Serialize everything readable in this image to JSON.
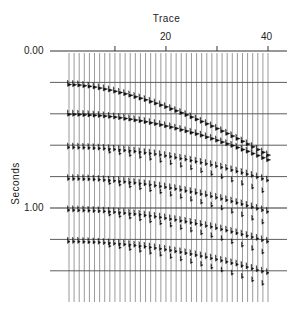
{
  "chart_data": {
    "type": "line",
    "title": "Trace",
    "xlabel": "Trace",
    "ylabel": "Seconds",
    "x_ticks": [
      10,
      20,
      30,
      40
    ],
    "x_tick_labels": [
      "",
      "20",
      "",
      "40"
    ],
    "y_tick_labels": [
      "0.00",
      "1.00"
    ],
    "y_gridlines_seconds": [
      0.0,
      0.2,
      0.4,
      0.6,
      0.8,
      1.0,
      1.2,
      1.4
    ],
    "traces": 40,
    "xlim": [
      1,
      40
    ],
    "ylim": [
      0.0,
      1.6
    ],
    "events": [
      {
        "name": "primary-reflection-1",
        "t0": 0.21,
        "t_end": 0.66
      },
      {
        "name": "primary-reflection-2",
        "t0": 0.4,
        "t_end": 0.69
      },
      {
        "name": "multiple-1",
        "t0": 0.61,
        "t_end": 0.82
      },
      {
        "name": "multiple-2",
        "t0": 0.81,
        "t_end": 1.02
      },
      {
        "name": "multiple-3",
        "t0": 1.01,
        "t_end": 1.21
      },
      {
        "name": "multiple-4",
        "t0": 1.21,
        "t_end": 1.41
      }
    ]
  },
  "labels": {
    "title": "Trace",
    "ylabel": "Seconds",
    "y0": "0.00",
    "y1": "1.00",
    "x20": "20",
    "x40": "40"
  }
}
